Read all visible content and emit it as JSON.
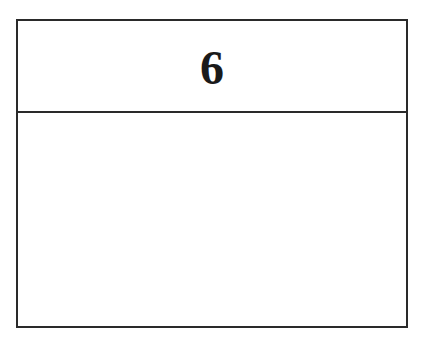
{
  "card": {
    "header_number": "6",
    "body_text": ""
  },
  "colors": {
    "border": "#2a2a2a",
    "text": "#1a1a1a",
    "background": "#ffffff"
  }
}
